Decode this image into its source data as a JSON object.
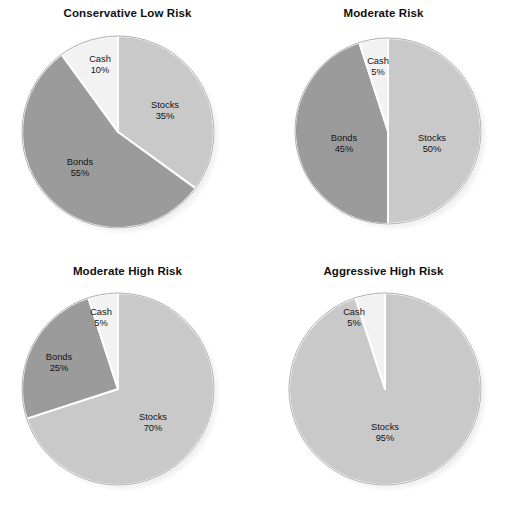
{
  "figure": {
    "background": "#ffffff",
    "label_text_color": "#141414",
    "title_text_color": "#111111"
  },
  "palette": {
    "stocks": "#c9c9c9",
    "bonds": "#9b9b9b",
    "cash": "#f2f2f2",
    "slice_edge": "#ffffff",
    "pie_outline": "#b0b0b0",
    "shadow": "#cfcfcf"
  },
  "chart_data": [
    {
      "type": "pie",
      "title": "Conservative Low Risk",
      "position": "top-left",
      "center": {
        "cx": 118,
        "cy": 132,
        "r": 96
      },
      "start_angle_deg": 0,
      "direction": "clockwise",
      "categories": [
        "Stocks",
        "Bonds",
        "Cash"
      ],
      "values": [
        35,
        55,
        10
      ],
      "slices": [
        {
          "name": "Stocks",
          "label": "Stocks",
          "value_label": "35%",
          "value": 35,
          "color": "#c9c9c9",
          "label_x": 165,
          "label_y": 106
        },
        {
          "name": "Bonds",
          "label": "Bonds",
          "value_label": "55%",
          "value": 55,
          "color": "#9b9b9b",
          "label_x": 80,
          "label_y": 163
        },
        {
          "name": "Cash",
          "label": "Cash",
          "value_label": "10%",
          "value": 10,
          "color": "#f2f2f2",
          "label_x": 100,
          "label_y": 60
        }
      ]
    },
    {
      "type": "pie",
      "title": "Moderate Risk",
      "position": "top-right",
      "center": {
        "cx": 132,
        "cy": 131,
        "r": 93
      },
      "start_angle_deg": 0,
      "direction": "clockwise",
      "categories": [
        "Stocks",
        "Bonds",
        "Cash"
      ],
      "values": [
        50,
        45,
        5
      ],
      "slices": [
        {
          "name": "Stocks",
          "label": "Stocks",
          "value_label": "50%",
          "value": 50,
          "color": "#c9c9c9",
          "label_x": 176,
          "label_y": 139
        },
        {
          "name": "Bonds",
          "label": "Bonds",
          "value_label": "45%",
          "value": 45,
          "color": "#9b9b9b",
          "label_x": 88,
          "label_y": 139
        },
        {
          "name": "Cash",
          "label": "Cash",
          "value_label": "5%",
          "value": 5,
          "color": "#f2f2f2",
          "label_x": 122,
          "label_y": 62
        }
      ]
    },
    {
      "type": "pie",
      "title": "Moderate High Risk",
      "position": "bottom-left",
      "center": {
        "cx": 118,
        "cy": 131,
        "r": 96
      },
      "start_angle_deg": 0,
      "direction": "clockwise",
      "categories": [
        "Stocks",
        "Bonds",
        "Cash"
      ],
      "values": [
        70,
        25,
        5
      ],
      "slices": [
        {
          "name": "Stocks",
          "label": "Stocks",
          "value_label": "70%",
          "value": 70,
          "color": "#c9c9c9",
          "label_x": 153,
          "label_y": 160
        },
        {
          "name": "Bonds",
          "label": "Bonds",
          "value_label": "25%",
          "value": 25,
          "color": "#9b9b9b",
          "label_x": 59,
          "label_y": 100
        },
        {
          "name": "Cash",
          "label": "Cash",
          "value_label": "5%",
          "value": 5,
          "color": "#f2f2f2",
          "label_x": 101,
          "label_y": 55
        }
      ]
    },
    {
      "type": "pie",
      "title": "Aggressive High Risk",
      "position": "bottom-right",
      "center": {
        "cx": 129,
        "cy": 131,
        "r": 96
      },
      "start_angle_deg": 0,
      "direction": "clockwise",
      "categories": [
        "Stocks",
        "Cash"
      ],
      "values": [
        95,
        5
      ],
      "slices": [
        {
          "name": "Stocks",
          "label": "Stocks",
          "value_label": "95%",
          "value": 95,
          "color": "#c9c9c9",
          "label_x": 129,
          "label_y": 170
        },
        {
          "name": "Cash",
          "label": "Cash",
          "value_label": "5%",
          "value": 5,
          "color": "#f2f2f2",
          "label_x": 98,
          "label_y": 55
        }
      ]
    }
  ]
}
